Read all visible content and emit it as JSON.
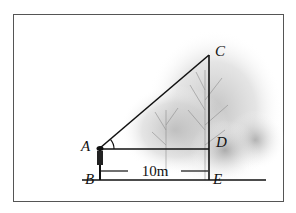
{
  "diagram": {
    "type": "geometry",
    "points": {
      "A": {
        "label": "A",
        "x": 100,
        "y": 148
      },
      "B": {
        "label": "B",
        "x": 100,
        "y": 180
      },
      "C": {
        "label": "C",
        "x": 209,
        "y": 55
      },
      "D": {
        "label": "D",
        "x": 209,
        "y": 148
      },
      "E": {
        "label": "E",
        "x": 209,
        "y": 180
      }
    },
    "segments": [
      "AC",
      "AD",
      "CE",
      "AB",
      "ground line through B and E"
    ],
    "angle_marker": {
      "vertex": "A",
      "between": [
        "AD",
        "AC"
      ]
    },
    "dimension": {
      "from": "B",
      "to": "E",
      "label": "10m",
      "value": 10,
      "unit": "m"
    },
    "colors": {
      "line": "#111111",
      "frame": "#555555",
      "background": "#ffffff",
      "tree_shading": "#9a9a9a"
    }
  }
}
